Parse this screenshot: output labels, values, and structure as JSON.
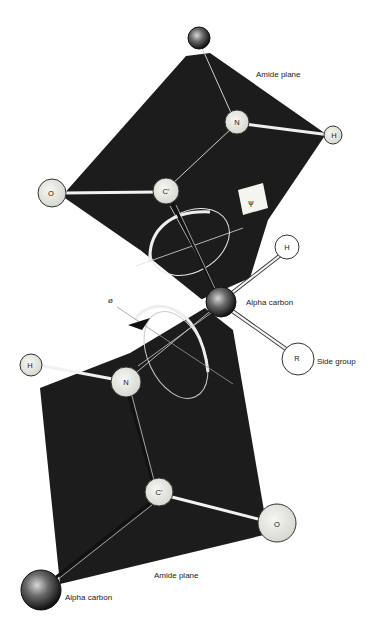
{
  "figure": {
    "colors": {
      "plane": "#1c1c1c",
      "background": "#ffffff",
      "atom_fill": "#e8e8e4",
      "atom_stroke": "#2a2a2a",
      "alpha_carbon": "#333333",
      "bond_light": "#f2f2f2",
      "bond_dark": "#111111"
    }
  },
  "labels": {
    "upper_plane": "Amide plane",
    "lower_plane": "Amide plane",
    "alpha_carbon_center": "Alpha carbon",
    "alpha_carbon_bottom": "Alpha carbon",
    "side_group": "Side group",
    "psi": "ψ",
    "phi": "ø"
  },
  "atoms": {
    "upper_alpha": {
      "label": "",
      "x": 199,
      "y": 38
    },
    "upper_N": {
      "label": "N",
      "x": 237,
      "y": 122
    },
    "upper_H": {
      "label": "H",
      "x": 333,
      "y": 135
    },
    "upper_O": {
      "label": "O",
      "x": 52,
      "y": 193
    },
    "upper_C": {
      "label": "C'",
      "x": 166,
      "y": 191
    },
    "center_alpha": {
      "label": "",
      "x": 221,
      "y": 302
    },
    "center_H": {
      "label": "H",
      "x": 287,
      "y": 247
    },
    "center_R": {
      "label": "R",
      "x": 298,
      "y": 359
    },
    "lower_H": {
      "label": "H",
      "x": 31,
      "y": 365
    },
    "lower_N": {
      "label": "N",
      "x": 126,
      "y": 382
    },
    "lower_C": {
      "label": "C'",
      "x": 159,
      "y": 492
    },
    "lower_O": {
      "label": "O",
      "x": 277,
      "y": 523
    },
    "lower_alpha": {
      "label": "",
      "x": 41,
      "y": 590
    }
  }
}
